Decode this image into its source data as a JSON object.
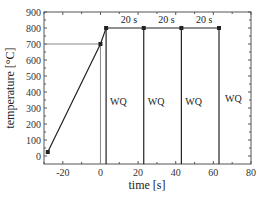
{
  "chart_data": {
    "type": "line",
    "title": "",
    "xlabel": "time [s]",
    "ylabel": "temperature [°C]",
    "xlim": [
      -30,
      80
    ],
    "ylim": [
      -50,
      900
    ],
    "xticks": [
      -20,
      0,
      20,
      40,
      60,
      80
    ],
    "yticks": [
      0,
      100,
      200,
      300,
      400,
      500,
      600,
      700,
      800,
      900
    ],
    "grid": false,
    "legend": null,
    "series": [
      {
        "name": "thermal cycle",
        "points": [
          {
            "x": -28,
            "y": 25
          },
          {
            "x": 0,
            "y": 700
          },
          {
            "x": 3,
            "y": 800
          },
          {
            "x": 23,
            "y": 800
          },
          {
            "x": 43,
            "y": 800
          },
          {
            "x": 63,
            "y": 800
          }
        ]
      }
    ],
    "quench_lines": [
      {
        "x": 3,
        "y_from": 800,
        "y_to": -50,
        "label": "WQ"
      },
      {
        "x": 23,
        "y_from": 800,
        "y_to": -50,
        "label": "WQ"
      },
      {
        "x": 43,
        "y_from": 800,
        "y_to": -50,
        "label": "WQ"
      },
      {
        "x": 63,
        "y_from": 800,
        "y_to": -50,
        "label": "WQ"
      }
    ],
    "reference_lines": [
      {
        "orientation": "horizontal",
        "y": 700,
        "x_from": -30,
        "x_to": 0
      },
      {
        "orientation": "vertical",
        "x": 0,
        "y_from": 700,
        "y_to": -50
      }
    ],
    "interval_annotations": [
      {
        "x_from": 3,
        "x_to": 23,
        "label": "20 s"
      },
      {
        "x_from": 23,
        "x_to": 43,
        "label": "20 s"
      },
      {
        "x_from": 43,
        "x_to": 63,
        "label": "20 s"
      }
    ]
  },
  "labels": {
    "xlabel": "time [s]",
    "ylabel": "temperature [°C]",
    "wq": "WQ",
    "interval": "20 s"
  },
  "colors": {
    "line": "#222222",
    "reference": "#888888",
    "frame": "#555555"
  }
}
